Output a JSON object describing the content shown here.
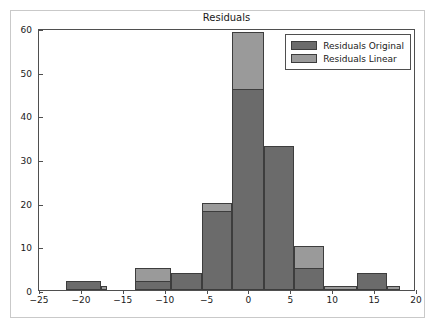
{
  "chart_data": {
    "type": "bar",
    "title": "Residuals",
    "xlabel": "",
    "ylabel": "",
    "xlim": [
      -25,
      20
    ],
    "ylim": [
      0,
      60
    ],
    "grid": false,
    "legend_position": "upper right",
    "xticks": [
      -25,
      -20,
      -15,
      -10,
      -5,
      0,
      5,
      10,
      15,
      20
    ],
    "xticklabels": [
      "−25",
      "−20",
      "−15",
      "−10",
      "−5",
      "0",
      "5",
      "10",
      "15",
      "20"
    ],
    "yticks": [
      0,
      10,
      20,
      30,
      40,
      50,
      60
    ],
    "yticklabels": [
      "0",
      "10",
      "20",
      "30",
      "40",
      "50",
      "60"
    ],
    "series": [
      {
        "name": "Residuals Original",
        "color": "#6b6b6b",
        "bins": [
          {
            "x0": -21.8,
            "x1": -17.6,
            "value": 2
          },
          {
            "x0": -13.6,
            "x1": -9.2,
            "value": 2
          },
          {
            "x0": -9.2,
            "x1": -5.6,
            "value": 4
          },
          {
            "x0": -5.6,
            "x1": -2.0,
            "value": 18
          },
          {
            "x0": -2.0,
            "x1": 1.9,
            "value": 46
          },
          {
            "x0": 1.9,
            "x1": 5.4,
            "value": 33
          },
          {
            "x0": 5.4,
            "x1": 9.0,
            "value": 5
          },
          {
            "x0": 12.9,
            "x1": 16.5,
            "value": 4
          }
        ]
      },
      {
        "name": "Residuals Linear",
        "color": "#9a9a9a",
        "bins": [
          {
            "x0": -21.8,
            "x1": -17.6,
            "value": 2
          },
          {
            "x0": -17.6,
            "x1": -16.9,
            "value": 1
          },
          {
            "x0": -13.6,
            "x1": -9.2,
            "value": 5
          },
          {
            "x0": -9.2,
            "x1": -5.6,
            "value": 4
          },
          {
            "x0": -5.6,
            "x1": -2.0,
            "value": 20
          },
          {
            "x0": -2.0,
            "x1": 1.9,
            "value": 59
          },
          {
            "x0": 1.9,
            "x1": 5.4,
            "value": 33
          },
          {
            "x0": 5.4,
            "x1": 9.0,
            "value": 10
          },
          {
            "x0": 9.0,
            "x1": 12.9,
            "value": 1
          },
          {
            "x0": 12.9,
            "x1": 16.5,
            "value": 4
          },
          {
            "x0": 16.5,
            "x1": 18.1,
            "value": 1
          }
        ]
      }
    ]
  }
}
